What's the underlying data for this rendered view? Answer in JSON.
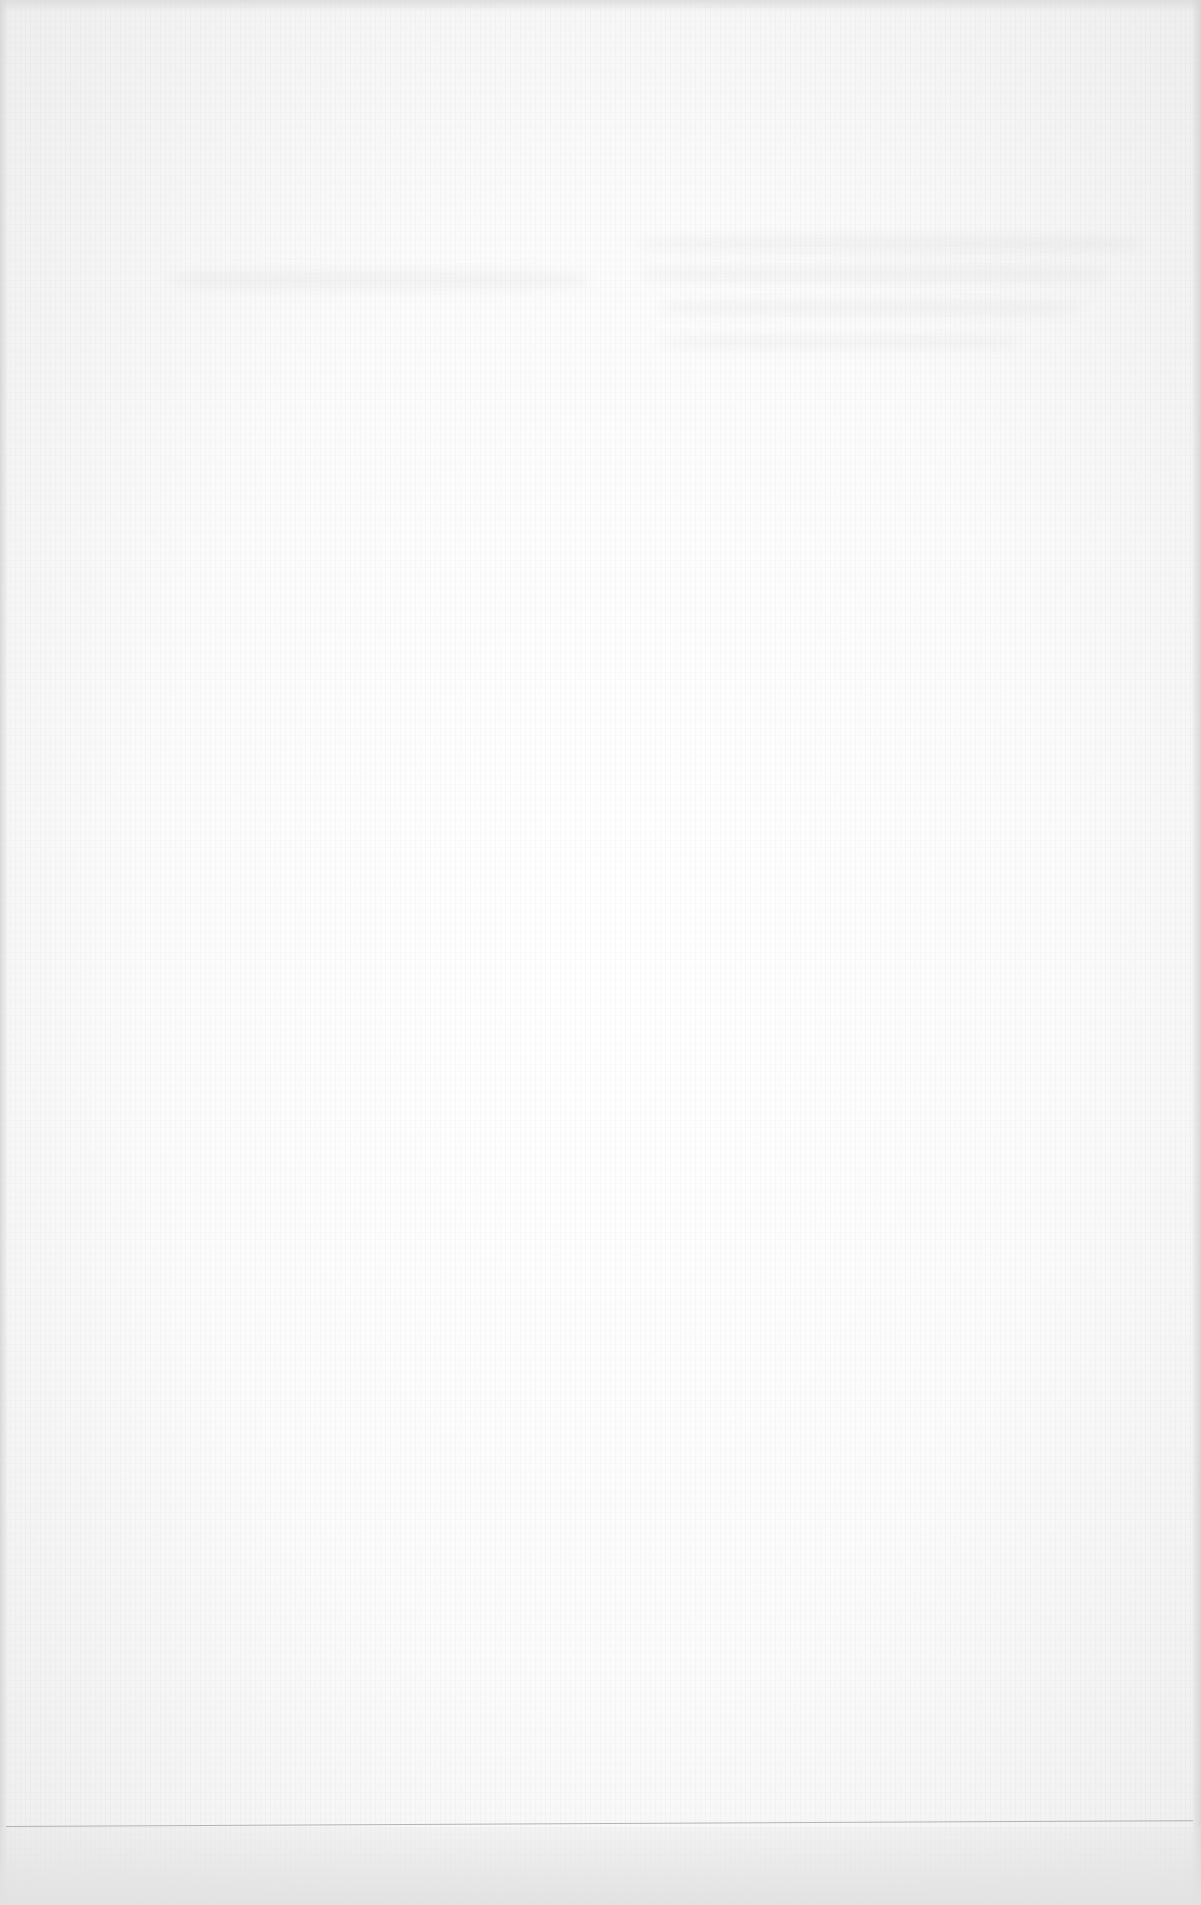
{
  "document": {
    "type": "scanned-page",
    "content": "blank",
    "visible_text": [],
    "elements": {
      "horizontal_rule": true,
      "show_through_marks": true
    },
    "colors": {
      "paper": "#fbfbfb",
      "edge_shadow": "#dcdcdc",
      "rule": "#9e9e9e"
    }
  }
}
